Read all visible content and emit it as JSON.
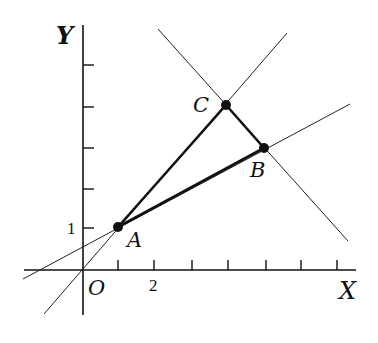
{
  "axes": {
    "x_label": "X",
    "y_label": "Y",
    "origin_label": "O",
    "x_tick_label": "2",
    "y_tick_label": "1"
  },
  "points": [
    {
      "name": "A",
      "x": 1,
      "y": 1
    },
    {
      "name": "B",
      "x": 5,
      "y": 3
    },
    {
      "name": "C",
      "x": 4,
      "y": 4
    }
  ],
  "colors": {
    "ink": "#111111",
    "background": "#ffffff"
  }
}
